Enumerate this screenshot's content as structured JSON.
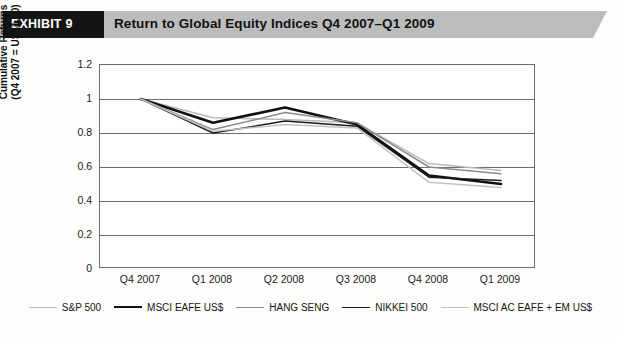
{
  "header": {
    "exhibit_label": "EXHIBIT 9",
    "title": "Return to Global Equity Indices Q4 2007–Q1 2009",
    "band_color": "#bcbcbc",
    "box_color": "#141414"
  },
  "chart_data": {
    "type": "line",
    "title": "Return to Global Equity Indices Q4 2007–Q1 2009",
    "xlabel": "",
    "ylabel": "Cumulative Returns (Q4 2007 = US$1.00)",
    "ylabel_lines": [
      "Cumulative Returns",
      "(Q4 2007 = US$1.00)"
    ],
    "categories": [
      "Q4 2007",
      "Q1 2008",
      "Q2 2008",
      "Q3 2008",
      "Q4 2008",
      "Q1 2009"
    ],
    "ylim": [
      0,
      1.2
    ],
    "ytick_labels": [
      "1.2",
      "1",
      "0.8",
      "0.6",
      "0.4",
      "0.2",
      "0"
    ],
    "ytick_values": [
      1.2,
      1.0,
      0.8,
      0.6,
      0.4,
      0.2,
      0
    ],
    "grid": true,
    "legend_position": "bottom",
    "series": [
      {
        "name": "S&P 500",
        "values": [
          1.0,
          0.89,
          0.88,
          0.86,
          0.62,
          0.58
        ],
        "color": "#b9b9b9",
        "width": 1.5
      },
      {
        "name": "MSCI EAFE US$",
        "values": [
          1.0,
          0.86,
          0.95,
          0.85,
          0.55,
          0.5
        ],
        "color": "#101010",
        "width": 2.6
      },
      {
        "name": "HANG SENG",
        "values": [
          1.0,
          0.82,
          0.92,
          0.86,
          0.6,
          0.56
        ],
        "color": "#8c8c8c",
        "width": 1.5
      },
      {
        "name": "NIKKEI 500",
        "values": [
          1.0,
          0.8,
          0.87,
          0.84,
          0.54,
          0.52
        ],
        "color": "#1c1c1c",
        "width": 1.5
      },
      {
        "name": "MSCI AC EAFE + EM US$",
        "values": [
          1.0,
          0.81,
          0.85,
          0.83,
          0.51,
          0.48
        ],
        "color": "#c2c2c2",
        "width": 1.5
      }
    ]
  }
}
